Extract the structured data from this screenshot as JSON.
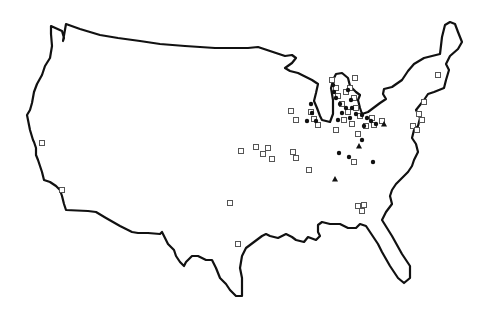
{
  "map": {
    "title": "",
    "region": "Contiguous United States",
    "background_color": "#ffffff",
    "outline_color": "#111111",
    "marker_types": [
      {
        "name": "open-square",
        "symbol": "square-outline",
        "color": "#555555"
      },
      {
        "name": "filled-circle",
        "symbol": "circle",
        "color": "#111111"
      },
      {
        "name": "filled-triangle",
        "symbol": "triangle",
        "color": "#111111"
      }
    ],
    "markers": {
      "squares": [
        [
          42,
          143
        ],
        [
          62,
          190
        ],
        [
          230,
          203
        ],
        [
          238,
          244
        ],
        [
          241,
          151
        ],
        [
          256,
          147
        ],
        [
          263,
          154
        ],
        [
          268,
          148
        ],
        [
          272,
          159
        ],
        [
          293,
          152
        ],
        [
          296,
          158
        ],
        [
          309,
          170
        ],
        [
          291,
          111
        ],
        [
          296,
          120
        ],
        [
          311,
          112
        ],
        [
          314,
          119
        ],
        [
          318,
          125
        ],
        [
          332,
          80
        ],
        [
          336,
          88
        ],
        [
          338,
          96
        ],
        [
          342,
          104
        ],
        [
          346,
          92
        ],
        [
          350,
          88
        ],
        [
          354,
          98
        ],
        [
          348,
          112
        ],
        [
          344,
          120
        ],
        [
          336,
          130
        ],
        [
          355,
          78
        ],
        [
          356,
          108
        ],
        [
          360,
          116
        ],
        [
          352,
          124
        ],
        [
          358,
          134
        ],
        [
          366,
          126
        ],
        [
          372,
          118
        ],
        [
          354,
          162
        ],
        [
          358,
          206
        ],
        [
          364,
          205
        ],
        [
          362,
          211
        ],
        [
          382,
          121
        ],
        [
          374,
          125
        ],
        [
          438,
          75
        ],
        [
          424,
          102
        ],
        [
          419,
          114
        ],
        [
          422,
          120
        ],
        [
          413,
          126
        ],
        [
          417,
          130
        ]
      ],
      "circles": [
        [
          311,
          104
        ],
        [
          312,
          113
        ],
        [
          307,
          121
        ],
        [
          316,
          121
        ],
        [
          333,
          85
        ],
        [
          334,
          92
        ],
        [
          336,
          98
        ],
        [
          340,
          104
        ],
        [
          346,
          108
        ],
        [
          342,
          113
        ],
        [
          348,
          90
        ],
        [
          351,
          100
        ],
        [
          352,
          108
        ],
        [
          356,
          114
        ],
        [
          350,
          118
        ],
        [
          338,
          120
        ],
        [
          362,
          115
        ],
        [
          367,
          118
        ],
        [
          371,
          121
        ],
        [
          376,
          124
        ],
        [
          364,
          126
        ],
        [
          362,
          140
        ],
        [
          339,
          153
        ],
        [
          349,
          157
        ],
        [
          373,
          162
        ]
      ],
      "triangles": [
        [
          384,
          124
        ],
        [
          359,
          146
        ],
        [
          335,
          179
        ]
      ]
    }
  }
}
